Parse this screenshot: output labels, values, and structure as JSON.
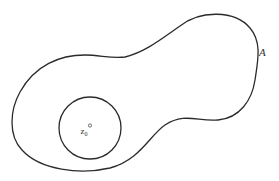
{
  "diagram": {
    "type": "region-with-disk",
    "colors": {
      "stroke": "#2b2b2b",
      "text": "#333333",
      "background": "#ffffff"
    },
    "region": {
      "label": "A",
      "description": "closed curve bounding region A"
    },
    "disk": {
      "description": "circle centered at z0 contained in region A"
    },
    "point": {
      "label_main": "z",
      "label_sub": "0",
      "description": "center point z0"
    }
  }
}
